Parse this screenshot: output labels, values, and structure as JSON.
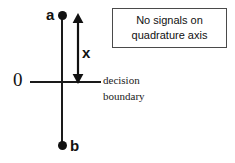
{
  "diagram": {
    "points": [
      {
        "id": "a",
        "label": "a",
        "position": "upper"
      },
      {
        "id": "b",
        "label": "b",
        "position": "lower"
      }
    ],
    "origin_label": "0",
    "distance_label": "x",
    "boundary_caption": {
      "line1": "decision",
      "line2": "boundary"
    },
    "callout": {
      "line1": "No signals on",
      "line2": "quadrature axis"
    },
    "colors": {
      "line": "#1a1a1a",
      "point": "#111111",
      "text": "#111111",
      "box_border": "#4a4a4a",
      "background": "#ffffff"
    }
  }
}
